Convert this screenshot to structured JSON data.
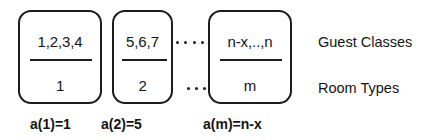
{
  "diagram": {
    "groups": [
      {
        "id": "group-1",
        "guest_classes": "1,2,3,4",
        "room_type": "1",
        "caption": "a(1)=1"
      },
      {
        "id": "group-2",
        "guest_classes": "5,6,7",
        "room_type": "2",
        "caption": "a(2)=5"
      },
      {
        "id": "group-m",
        "guest_classes": "n-x,..,n",
        "room_type": "m",
        "caption": "a(m)=n-x"
      }
    ],
    "row_labels": {
      "top": "Guest Classes",
      "bottom": "Room Types"
    },
    "ellipses": {
      "top_dot_count": 4,
      "bottom_dot_count": 3
    },
    "colors": {
      "stroke": "#1c1c1c",
      "text": "#141414",
      "background": "#ffffff"
    }
  }
}
